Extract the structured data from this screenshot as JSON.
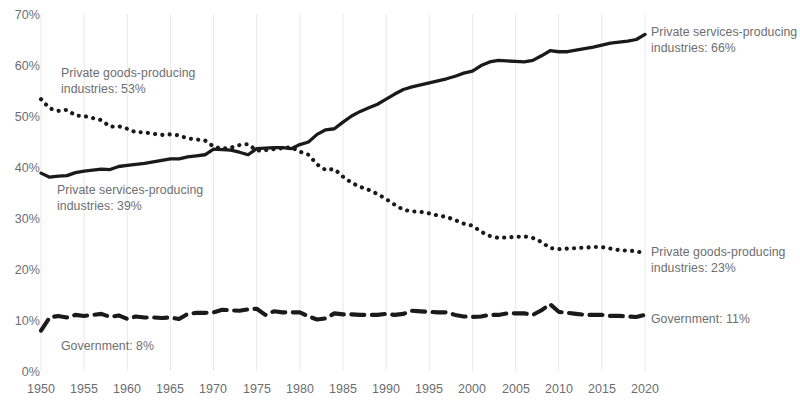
{
  "chart_data": {
    "type": "line",
    "title": "",
    "subtitle": "",
    "xlabel": "",
    "ylabel": "",
    "xlim": [
      1950,
      2021
    ],
    "ylim": [
      0,
      70
    ],
    "grid": "vertical-only",
    "legend_position": "inline-annotations",
    "y_ticks": [
      "0%",
      "10%",
      "20%",
      "30%",
      "40%",
      "50%",
      "60%",
      "70%"
    ],
    "y_tick_values": [
      0,
      10,
      20,
      30,
      40,
      50,
      60,
      70
    ],
    "x_ticks": [
      "1950",
      "1955",
      "1960",
      "1965",
      "1970",
      "1975",
      "1980",
      "1985",
      "1990",
      "1995",
      "2000",
      "2005",
      "2010",
      "2015",
      "2020"
    ],
    "x_tick_values": [
      1950,
      1955,
      1960,
      1965,
      1970,
      1975,
      1980,
      1985,
      1990,
      1995,
      2000,
      2005,
      2010,
      2015,
      2020
    ],
    "x": [
      1950,
      1951,
      1952,
      1953,
      1954,
      1955,
      1956,
      1957,
      1958,
      1959,
      1960,
      1961,
      1962,
      1963,
      1964,
      1965,
      1966,
      1967,
      1968,
      1969,
      1970,
      1971,
      1972,
      1973,
      1974,
      1975,
      1976,
      1977,
      1978,
      1979,
      1980,
      1981,
      1982,
      1983,
      1984,
      1985,
      1986,
      1987,
      1988,
      1989,
      1990,
      1991,
      1992,
      1993,
      1994,
      1995,
      1996,
      1997,
      1998,
      1999,
      2000,
      2001,
      2002,
      2003,
      2004,
      2005,
      2006,
      2007,
      2008,
      2009,
      2010,
      2011,
      2012,
      2013,
      2014,
      2015,
      2016,
      2017,
      2018,
      2019,
      2020
    ],
    "series": [
      {
        "name": "Private services-producing industries",
        "style": "solid",
        "color": "#1a1a1a",
        "start_value": 39,
        "end_value": 66,
        "values": [
          38.8,
          38.0,
          38.2,
          38.3,
          38.9,
          39.2,
          39.4,
          39.6,
          39.5,
          40.1,
          40.3,
          40.5,
          40.7,
          41.0,
          41.3,
          41.6,
          41.6,
          42.0,
          42.2,
          42.4,
          43.5,
          43.4,
          43.3,
          42.9,
          42.4,
          43.6,
          43.7,
          43.8,
          43.8,
          43.6,
          44.4,
          44.9,
          46.4,
          47.3,
          47.5,
          48.8,
          50.0,
          50.9,
          51.6,
          52.3,
          53.3,
          54.3,
          55.2,
          55.7,
          56.1,
          56.5,
          56.9,
          57.3,
          57.8,
          58.4,
          58.8,
          59.9,
          60.6,
          60.9,
          60.8,
          60.7,
          60.6,
          60.9,
          61.8,
          62.8,
          62.6,
          62.6,
          62.9,
          63.2,
          63.5,
          63.9,
          64.3,
          64.5,
          64.7,
          65.0,
          66.0
        ]
      },
      {
        "name": "Private goods-producing industries",
        "style": "dotted",
        "color": "#1a1a1a",
        "start_value": 53,
        "end_value": 23,
        "values": [
          53.3,
          51.5,
          51.0,
          51.2,
          50.1,
          50.0,
          49.6,
          49.2,
          47.9,
          48.0,
          47.5,
          46.8,
          46.8,
          46.5,
          46.3,
          46.4,
          46.2,
          45.6,
          45.4,
          45.2,
          44.0,
          43.6,
          43.8,
          44.3,
          44.5,
          43.2,
          43.3,
          43.5,
          43.7,
          43.9,
          43.0,
          42.4,
          40.5,
          39.4,
          39.6,
          38.1,
          36.9,
          36.1,
          35.5,
          34.7,
          33.7,
          32.6,
          31.6,
          31.3,
          31.2,
          30.9,
          30.5,
          30.2,
          29.6,
          28.9,
          28.5,
          27.3,
          26.5,
          26.1,
          26.2,
          26.3,
          26.4,
          26.1,
          25.3,
          24.1,
          23.9,
          24.0,
          24.1,
          24.2,
          24.3,
          24.3,
          24.0,
          23.7,
          23.6,
          23.5,
          23.0
        ]
      },
      {
        "name": "Government",
        "style": "dashed",
        "color": "#1a1a1a",
        "start_value": 8,
        "end_value": 11,
        "values": [
          7.9,
          10.5,
          10.8,
          10.5,
          11.0,
          10.8,
          11.0,
          11.2,
          10.6,
          10.9,
          10.2,
          10.7,
          10.5,
          10.5,
          10.4,
          10.5,
          10.2,
          11.2,
          11.4,
          11.4,
          11.5,
          12.0,
          11.9,
          11.8,
          12.1,
          12.2,
          11.0,
          11.7,
          11.5,
          11.5,
          11.5,
          10.7,
          10.1,
          10.3,
          11.3,
          11.1,
          11.1,
          11.0,
          11.0,
          11.0,
          11.2,
          11.0,
          11.2,
          11.8,
          11.7,
          11.6,
          11.5,
          11.5,
          11.0,
          10.7,
          10.6,
          10.7,
          11.0,
          11.0,
          11.3,
          11.3,
          11.3,
          11.0,
          11.9,
          13.1,
          11.6,
          11.4,
          11.2,
          11.0,
          11.0,
          11.0,
          10.8,
          10.8,
          10.7,
          10.6,
          11.0
        ]
      }
    ],
    "annotations": [
      {
        "id": "goods-start",
        "line1": "Private goods-producing",
        "line2": "industries: 53%"
      },
      {
        "id": "services-start",
        "line1": "Private services-producing",
        "line2": "industries: 39%"
      },
      {
        "id": "government-start",
        "line1": "Government: 8%",
        "line2": ""
      },
      {
        "id": "services-end",
        "line1": "Private services-producing",
        "line2": "industries: 66%"
      },
      {
        "id": "goods-end",
        "line1": "Private goods-producing",
        "line2": "industries: 23%"
      },
      {
        "id": "government-end",
        "line1": "Government: 11%",
        "line2": ""
      }
    ]
  },
  "colors": {
    "ink": "#1a1a1a",
    "axis_text": "#6d6e71",
    "gridline": "#e8e8e8",
    "background": "#ffffff"
  }
}
